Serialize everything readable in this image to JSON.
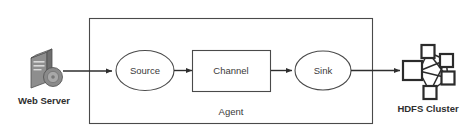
{
  "diagram": {
    "endpoints": [
      {
        "id": "web-server",
        "label": "Web Server",
        "icon": "server-tower-icon"
      },
      {
        "id": "hdfs-cluster",
        "label": "HDFS Cluster",
        "icon": "cluster-network-icon"
      }
    ],
    "container": {
      "id": "agent",
      "label": "Agent",
      "shape": "rectangle"
    },
    "nodes": [
      {
        "id": "source",
        "label": "Source",
        "shape": "ellipse"
      },
      {
        "id": "channel",
        "label": "Channel",
        "shape": "rectangle"
      },
      {
        "id": "sink",
        "label": "Sink",
        "shape": "ellipse"
      }
    ],
    "flows": [
      {
        "from": "web-server",
        "to": "source"
      },
      {
        "from": "source",
        "to": "channel"
      },
      {
        "from": "channel",
        "to": "sink"
      },
      {
        "from": "sink",
        "to": "hdfs-cluster"
      }
    ],
    "colors": {
      "background": "#ffffff",
      "stroke": "#4a4a4a",
      "arrow": "#2e2e2e",
      "text": "#3a3a3a",
      "cluster": "#2b2b2b",
      "server_icon": "#8e8e8e"
    }
  }
}
